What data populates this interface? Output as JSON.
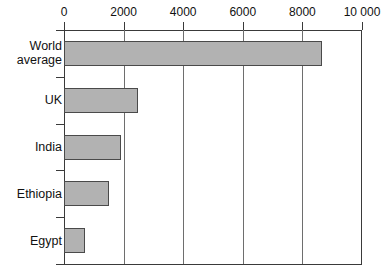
{
  "chart_data": {
    "type": "bar",
    "orientation": "horizontal",
    "title": "",
    "xlabel": "",
    "ylabel": "",
    "categories": [
      "World average",
      "UK",
      "India",
      "Ethiopia",
      "Egypt"
    ],
    "values": [
      8650,
      2480,
      1900,
      1500,
      700
    ],
    "series": [
      {
        "name": "",
        "values": [
          8650,
          2480,
          1900,
          1500,
          700
        ]
      }
    ],
    "xlim": [
      0,
      10000
    ],
    "xticks": [
      0,
      2000,
      4000,
      6000,
      8000,
      10000
    ],
    "xtick_labels": [
      "0",
      "2000",
      "4000",
      "6000",
      "8000",
      "10 000"
    ],
    "grid": true,
    "grid_axis": "x",
    "legend": false,
    "legend_position": "none",
    "bar_fill_color": "#b2b2b2",
    "bar_edge_color": "#4a4a4a",
    "axis_color": "#3a3a3a",
    "grid_color": "#6e6e6e",
    "background_color": "#ffffff"
  },
  "axis": {
    "ticks": [
      {
        "label": "0",
        "value": 0
      },
      {
        "label": "2000",
        "value": 2000
      },
      {
        "label": "4000",
        "value": 4000
      },
      {
        "label": "6000",
        "value": 6000
      },
      {
        "label": "8000",
        "value": 8000
      },
      {
        "label": "10 000",
        "value": 10000
      }
    ]
  },
  "rows": [
    {
      "label_line1": "World",
      "label_line2": "average",
      "value": 8650
    },
    {
      "label_line1": "UK",
      "label_line2": "",
      "value": 2480
    },
    {
      "label_line1": "India",
      "label_line2": "",
      "value": 1900
    },
    {
      "label_line1": "Ethiopia",
      "label_line2": "",
      "value": 1500
    },
    {
      "label_line1": "Egypt",
      "label_line2": "",
      "value": 700
    }
  ]
}
